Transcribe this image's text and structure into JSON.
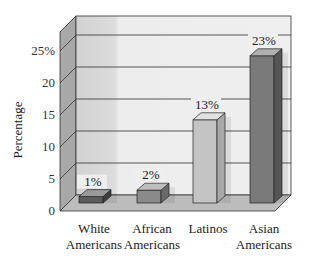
{
  "chart_data": {
    "type": "bar",
    "style": "3d",
    "title": "",
    "xlabel": "",
    "ylabel": "Percentage",
    "categories": [
      "White Americans",
      "African Americans",
      "Latinos",
      "Asian Americans"
    ],
    "category_lines": [
      [
        "White",
        "Americans"
      ],
      [
        "African",
        "Americans"
      ],
      [
        "Latinos",
        ""
      ],
      [
        "Asian",
        "Americans"
      ]
    ],
    "values": [
      1,
      2,
      13,
      23
    ],
    "data_labels": [
      "1%",
      "2%",
      "13%",
      "23%"
    ],
    "yticks": [
      "0",
      "5",
      "10",
      "15",
      "20",
      "25%"
    ],
    "ytick_values": [
      0,
      5,
      10,
      15,
      20,
      25
    ],
    "ylim": [
      0,
      27
    ],
    "grid": true,
    "legend": null,
    "colors": {
      "bars": [
        "#5c5c5c",
        "#8a8a8a",
        "#c4c4c4",
        "#7a7a7a"
      ],
      "bar_sides": [
        "#3e3e3e",
        "#6a6a6a",
        "#a8a8a8",
        "#555555"
      ],
      "bar_tops": [
        "#9a9a9a",
        "#bdbdbd",
        "#e2e2e2",
        "#b0b0b0"
      ],
      "back_wall": "#ececec",
      "side_wall": "#a9a9a9",
      "floor": "#bdbdbd",
      "gridline": "#444444"
    }
  }
}
